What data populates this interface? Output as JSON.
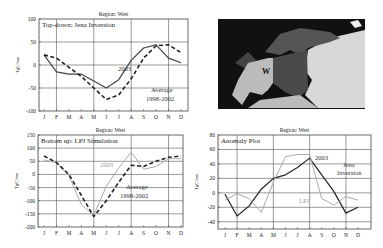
{
  "chart_data": [
    {
      "type": "line",
      "title": "Region: West",
      "subtitle": "Top-down: Jena Inversion",
      "xlabel": "",
      "ylabel": "TgC/mo",
      "ylim": [
        -100,
        100
      ],
      "yticks": [
        -100,
        -50,
        0,
        50,
        100
      ],
      "categories": [
        "J",
        "F",
        "M",
        "A",
        "M",
        "J",
        "J",
        "A",
        "S",
        "O",
        "N",
        "D"
      ],
      "grid": true,
      "series": [
        {
          "name": "2003",
          "style": "solid",
          "color": "#444444",
          "values": [
            22,
            -15,
            -20,
            -20,
            -35,
            -50,
            -32,
            10,
            37,
            44,
            15,
            5
          ]
        },
        {
          "name": "Average 1998-2002",
          "style": "dashed",
          "color": "#222222",
          "values": [
            22,
            15,
            -5,
            -25,
            -50,
            -75,
            -65,
            -30,
            15,
            42,
            44,
            27
          ]
        }
      ],
      "annotations": [
        {
          "text": "2003",
          "x": "J",
          "y": -25
        },
        {
          "text": "Average",
          "x": "S",
          "y": -45
        },
        {
          "text": "1998-2002",
          "x": "S",
          "y": -60
        }
      ]
    },
    {
      "type": "line",
      "title": "Region: West",
      "subtitle": "Bottom up: LPJ Simulation",
      "xlabel": "",
      "ylabel": "TgC/mo",
      "ylim": [
        -200,
        150
      ],
      "yticks": [
        -200,
        -150,
        -100,
        -50,
        0,
        50,
        100,
        150
      ],
      "categories": [
        "J",
        "F",
        "M",
        "A",
        "M",
        "J",
        "J",
        "A",
        "S",
        "O",
        "N",
        "D"
      ],
      "grid": true,
      "series": [
        {
          "name": "2003",
          "style": "solid",
          "color": "#aaaaaa",
          "values": [
            55,
            45,
            -5,
            -115,
            -155,
            -45,
            25,
            85,
            20,
            30,
            60,
            60
          ]
        },
        {
          "name": "Average 1998-2002",
          "style": "dashed",
          "color": "#222222",
          "values": [
            70,
            45,
            0,
            -80,
            -160,
            -100,
            -30,
            35,
            30,
            50,
            65,
            70
          ]
        }
      ],
      "annotations": [
        {
          "text": "2003",
          "x": "J",
          "y": 30
        },
        {
          "text": "Average",
          "x": "A",
          "y": -50
        },
        {
          "text": "1998-2002",
          "x": "A",
          "y": -85
        }
      ]
    },
    {
      "type": "line",
      "title": "Region: West",
      "subtitle": "Anomaly Plot",
      "xlabel": "",
      "ylabel": "TgC/mo",
      "ylim": [
        -50,
        80
      ],
      "yticks": [
        -40,
        -20,
        0,
        20,
        40,
        60,
        80
      ],
      "categories": [
        "J",
        "F",
        "M",
        "A",
        "M",
        "J",
        "J",
        "A",
        "S",
        "O",
        "N",
        "D"
      ],
      "grid": true,
      "series": [
        {
          "name": "Jena Inversion",
          "style": "solid",
          "color": "#222222",
          "values": [
            -2,
            -32,
            -18,
            5,
            20,
            25,
            35,
            48,
            25,
            2,
            -28,
            -20
          ]
        },
        {
          "name": "LPJ",
          "style": "solid",
          "color": "#aaaaaa",
          "values": [
            -10,
            -1,
            -8,
            -27,
            15,
            50,
            53,
            53,
            -8,
            -17,
            -5,
            -10
          ]
        }
      ],
      "annotations": [
        {
          "text": "2003",
          "x": "S",
          "y": 52
        },
        {
          "text": "Jena",
          "x": "N",
          "y": 45
        },
        {
          "text": "Inversion",
          "x": "N",
          "y": 33
        },
        {
          "text": "LPJ",
          "x": "J",
          "y": -8
        }
      ]
    }
  ],
  "map": {
    "label": "W",
    "description": "Map of Europe with West region highlighted"
  }
}
